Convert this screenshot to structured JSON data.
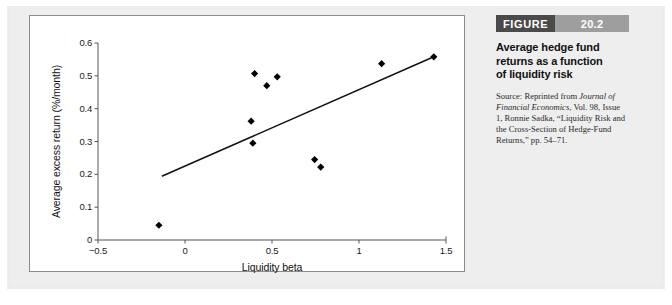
{
  "figure": {
    "badge_label": "FIGURE",
    "badge_number": "20.2",
    "title": "Average hedge fund returns as a function of liquidity risk",
    "source_prefix": "Source: Reprinted from ",
    "source_journal": "Journal of Financial Economics",
    "source_rest": ", Vol. 98, Issue 1, Ronnie Sadka, “Liquidity Risk and the Cross-Section of Hedge-Fund Returns,” pp. 54–71.",
    "badge_dark_color": "#4a4a4a",
    "badge_light_color": "#9e9e9e",
    "panel_color": "#ececec"
  },
  "chart_data": {
    "type": "scatter",
    "title": "",
    "xlabel": "Liquidity beta",
    "ylabel": "Average excess return (%/month)",
    "xlim": [
      -0.5,
      1.5
    ],
    "ylim": [
      0,
      0.6
    ],
    "xticks": [
      -0.5,
      0,
      0.5,
      1,
      1.5
    ],
    "xticklabels": [
      "−0.5",
      "0",
      "0.5",
      "1",
      "1.5"
    ],
    "yticks": [
      0,
      0.1,
      0.2,
      0.3,
      0.4,
      0.5,
      0.6
    ],
    "yticklabels": [
      "0",
      "0.1",
      "0.2",
      "0.3",
      "0.4",
      "0.5",
      "0.6"
    ],
    "grid": false,
    "legend": null,
    "marker": "diamond",
    "marker_color": "#000000",
    "points": [
      {
        "x": -0.15,
        "y": 0.045
      },
      {
        "x": 0.38,
        "y": 0.362
      },
      {
        "x": 0.39,
        "y": 0.295
      },
      {
        "x": 0.4,
        "y": 0.507
      },
      {
        "x": 0.47,
        "y": 0.47
      },
      {
        "x": 0.53,
        "y": 0.497
      },
      {
        "x": 0.745,
        "y": 0.245
      },
      {
        "x": 0.78,
        "y": 0.222
      },
      {
        "x": 1.13,
        "y": 0.537
      },
      {
        "x": 1.43,
        "y": 0.558
      }
    ],
    "trendline": {
      "type": "line",
      "color": "#111111",
      "x0": -0.13,
      "y0": 0.195,
      "x1": 1.43,
      "y1": 0.558
    }
  }
}
